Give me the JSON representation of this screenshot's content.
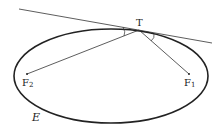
{
  "diagram": {
    "labels": {
      "tangent_point": "T",
      "focus_2": "F",
      "focus_2_sub": "2",
      "focus_1": "F",
      "focus_1_sub": "1",
      "ellipse": "E"
    },
    "ellipse": {
      "cx": 111,
      "cy": 76,
      "rx": 97,
      "ry": 47
    },
    "points": {
      "T": [
        139,
        30
      ],
      "F2": [
        27,
        74
      ],
      "F1": [
        189,
        74
      ]
    },
    "tangent_line": [
      [
        19,
        9
      ],
      [
        212,
        43
      ]
    ],
    "colors": {
      "stroke": "#222222",
      "background": "#ffffff"
    }
  }
}
